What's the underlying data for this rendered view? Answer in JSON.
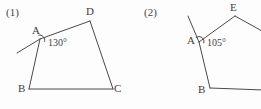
{
  "page": {
    "background_color": "#fdfdfd",
    "ink_color": "#4a4a4a",
    "width": 261,
    "height": 109
  },
  "figures": [
    {
      "index_label": "(1)",
      "shape": "quadrilateral",
      "vertices": [
        {
          "name": "A",
          "label": "A",
          "x": 40,
          "y": 39,
          "label_x": 32,
          "label_y": 25
        },
        {
          "name": "B",
          "label": "B",
          "x": 29,
          "y": 89,
          "label_x": 18,
          "label_y": 83
        },
        {
          "name": "C",
          "label": "C",
          "x": 113,
          "y": 89,
          "label_x": 114,
          "label_y": 83
        },
        {
          "name": "D",
          "label": "D",
          "x": 90,
          "y": 21,
          "label_x": 86,
          "label_y": 6
        }
      ],
      "edges": [
        {
          "from": "A",
          "to": "B"
        },
        {
          "from": "B",
          "to": "C"
        },
        {
          "from": "C",
          "to": "D"
        },
        {
          "from": "D",
          "to": "A"
        }
      ],
      "extension_ray": {
        "name": "ray-through-A",
        "from_x": 40,
        "from_y": 39,
        "to_x": 17,
        "to_y": 53
      },
      "angle": {
        "at_vertex": "A",
        "value_label": "130°",
        "label_x": 48,
        "label_y": 38,
        "arc_cx": 42,
        "arc_cy": 40,
        "arc_r": 5
      }
    },
    {
      "index_label": "(2)",
      "shape": "pentagon",
      "vertices": [
        {
          "name": "A",
          "label": "A",
          "x": 69,
          "y": 42,
          "label_x": 57,
          "label_y": 35
        },
        {
          "name": "B",
          "label": "B",
          "x": 80,
          "y": 88,
          "label_x": 68,
          "label_y": 84
        },
        {
          "name": "C",
          "label": "C",
          "x": 134,
          "y": 90,
          "label_x": 133,
          "label_y": 84
        },
        {
          "name": "D",
          "label": "D",
          "x": 141,
          "y": 36,
          "label_x": 140,
          "label_y": 30
        },
        {
          "name": "E",
          "label": "E",
          "x": 105,
          "y": 16,
          "label_x": 100,
          "label_y": 2
        }
      ],
      "edges": [
        {
          "from": "A",
          "to": "B"
        },
        {
          "from": "B",
          "to": "C"
        },
        {
          "from": "C",
          "to": "D"
        },
        {
          "from": "D",
          "to": "E"
        },
        {
          "from": "E",
          "to": "A"
        }
      ],
      "extension_ray": {
        "name": "ray-through-A",
        "from_x": 69,
        "from_y": 42,
        "to_x": 58,
        "to_y": 16
      },
      "angle": {
        "at_vertex": "A",
        "value_label": "105°",
        "label_x": 77,
        "label_y": 38,
        "arc_cx": 71,
        "arc_cy": 41,
        "arc_r": 5
      }
    }
  ]
}
